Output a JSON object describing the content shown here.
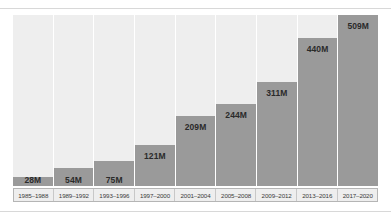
{
  "chart_data": {
    "type": "bar",
    "title": "",
    "xlabel": "",
    "ylabel": "",
    "ylim": [
      0,
      509
    ],
    "grid": false,
    "legend": "none",
    "categories": [
      "1985–1988",
      "1989–1992",
      "1993–1996",
      "1997–2000",
      "2001–2004",
      "2005–2008",
      "2009–2012",
      "2013–2016",
      "2017–2020"
    ],
    "values": [
      28,
      54,
      75,
      121,
      209,
      244,
      311,
      440,
      509
    ],
    "value_labels": [
      "28M",
      "54M",
      "75M",
      "121M",
      "209M",
      "244M",
      "311M",
      "440M",
      "509M"
    ],
    "colors": {
      "bar": "#9a9a9a",
      "column_background": "#eeeeee",
      "value_label_text": "#2a2a2a",
      "axis_label_text": "#3a3a3a",
      "axis_strip_background": "#eeeeee",
      "axis_strip_border": "#b5b5b5",
      "rule": "#d8d8d8",
      "page_background": "#ffffff"
    }
  }
}
